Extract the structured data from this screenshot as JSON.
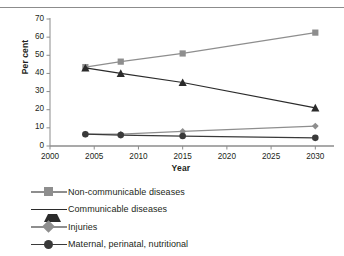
{
  "chart_data": {
    "type": "line",
    "title": "",
    "subtitle": "",
    "xlabel": "Year",
    "ylabel": "Per cent",
    "xlim": [
      2000,
      2032
    ],
    "ylim": [
      0,
      70
    ],
    "grid": false,
    "legend_position": "below-left",
    "x": [
      2004,
      2008,
      2015,
      2030
    ],
    "xticks": [
      2000,
      2005,
      2010,
      2015,
      2020,
      2025,
      2030
    ],
    "yticks": [
      0,
      10,
      20,
      30,
      40,
      50,
      60,
      70
    ],
    "series": [
      {
        "name": "Non-communicable diseases",
        "values": [
          43.5,
          46.5,
          51,
          62.5
        ],
        "marker": "square",
        "color": "#8e8e8e"
      },
      {
        "name": "Communicable diseases",
        "values": [
          43,
          40,
          35,
          21
        ],
        "marker": "triangle",
        "color": "#2b2b2b"
      },
      {
        "name": "Injuries",
        "values": [
          6.5,
          6.5,
          8,
          11
        ],
        "marker": "diamond",
        "color": "#8e8e8e"
      },
      {
        "name": "Maternal, perinatal, nutritional",
        "values": [
          6.5,
          6,
          5.5,
          4.5
        ],
        "marker": "circle",
        "color": "#3a3a3a"
      }
    ]
  },
  "axes": {
    "y_title": "Per cent",
    "x_title": "Year",
    "y_tick_labels": [
      "70",
      "60",
      "50",
      "40",
      "30",
      "20",
      "10",
      "0"
    ],
    "x_tick_labels": [
      "2000",
      "2005",
      "2010",
      "2015",
      "2020",
      "2025",
      "2030"
    ]
  },
  "legend": {
    "items": [
      {
        "label": "Non-communicable diseases",
        "marker": "square-marker",
        "color": "#8e8e8e"
      },
      {
        "label": "Communicable diseases",
        "marker": "triangle-marker",
        "color": "#2b2b2b"
      },
      {
        "label": "Injuries",
        "marker": "diamond-marker",
        "color": "#8e8e8e"
      },
      {
        "label": "Maternal, perinatal, nutritional",
        "marker": "circle-marker",
        "color": "#3a3a3a"
      }
    ]
  },
  "style": {
    "axis_color": "#8c8c8c",
    "text_color": "#231f20",
    "background": "#ffffff"
  }
}
